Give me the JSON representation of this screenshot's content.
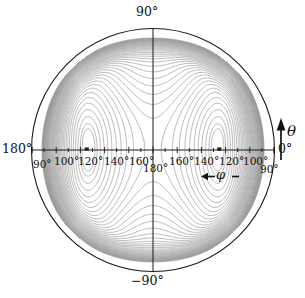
{
  "figure": {
    "type": "polar-contour-plot"
  },
  "axes": {
    "angular_labels": {
      "top": "90°",
      "bottom": "−90°",
      "left": "180°",
      "right": "0°"
    },
    "radial_labels_left": [
      "90°",
      "100°",
      "120°",
      "140°",
      "160°"
    ],
    "center_label": "180°",
    "radial_labels_right": [
      "160°",
      "140°",
      "120°",
      "100°",
      "90°"
    ],
    "theta_axis_label": "θ",
    "phi_axis_label": "φ",
    "phi_annotation_left_arrow": "←",
    "phi_annotation_right_dash": "–"
  },
  "colors": {
    "background": "#ffffff",
    "axis": "#1a1a1a",
    "boundary": "#1a1a1a",
    "contour": "#808080",
    "contour_dense": "#8a8a8a",
    "marker": "#222222",
    "text": "#111111"
  },
  "chart_data": {
    "type": "contour",
    "title": "",
    "xlabel": "φ",
    "ylabel": "θ",
    "projection": "polar",
    "grid": false,
    "legend": null,
    "radial_axis": {
      "center_value": 180,
      "edge_value": 90,
      "tick_values_left": [
        90,
        100,
        120,
        140,
        160
      ],
      "tick_values_right": [
        160,
        140,
        120,
        100,
        90
      ],
      "minor_ticks_per_major": 1,
      "unit": "degrees"
    },
    "angular_axis": {
      "top": 90,
      "right": 0,
      "bottom": -90,
      "left": 180,
      "unit": "degrees"
    },
    "minima": [
      {
        "phi": 130,
        "theta": 0,
        "side": "left",
        "marker": "filled-square"
      },
      {
        "phi": 130,
        "theta": 0,
        "side": "right",
        "marker": "filled-square"
      }
    ],
    "saddles": [
      {
        "phi": 180,
        "theta": 0,
        "location": "center"
      },
      {
        "phi": 180,
        "theta": 55,
        "location": "top-center"
      },
      {
        "phi": 180,
        "theta": -55,
        "location": "bottom-center"
      }
    ],
    "n_contour_levels": 24,
    "contour_spacing": "uniform",
    "dense_gradient_regions": [
      "left-edge",
      "right-edge"
    ],
    "symmetry": "mirror about vertical axis and horizontal axis"
  }
}
